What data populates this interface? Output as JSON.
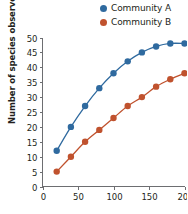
{
  "legend": {
    "position": "top-right",
    "entries": [
      {
        "label": "Community A",
        "color": "#2f6a9f",
        "marker": "circle-marker-icon"
      },
      {
        "label": "Community B",
        "color": "#c0522e",
        "marker": "circle-marker-icon"
      }
    ]
  },
  "axes": {
    "ylabel": "Number of species observed",
    "xlabel": "",
    "yticks": [
      "0",
      "5",
      "10",
      "15",
      "20",
      "25",
      "30",
      "35",
      "40",
      "45",
      "50"
    ],
    "xticks": [
      "0",
      "50",
      "100",
      "150",
      "200"
    ]
  },
  "chart_data": {
    "type": "line",
    "title": "",
    "xlabel": "",
    "ylabel": "Number of species observed",
    "xlim": [
      0,
      200
    ],
    "ylim": [
      0,
      50
    ],
    "xtick_values": [
      0,
      50,
      100,
      150,
      200
    ],
    "ytick_values": [
      0,
      5,
      10,
      15,
      20,
      25,
      30,
      35,
      40,
      45,
      50
    ],
    "grid": false,
    "legend_position": "top-right",
    "markers": "filled-circle",
    "x": [
      20,
      40,
      60,
      80,
      100,
      120,
      140,
      160,
      180,
      200
    ],
    "series": [
      {
        "name": "Community A",
        "color": "#2f6a9f",
        "values": [
          12,
          20,
          27,
          33,
          38,
          42,
          45,
          47,
          48,
          48
        ]
      },
      {
        "name": "Community B",
        "color": "#c0522e",
        "values": [
          5,
          10,
          15,
          19,
          23,
          27,
          30,
          33.5,
          36,
          38
        ]
      }
    ]
  }
}
